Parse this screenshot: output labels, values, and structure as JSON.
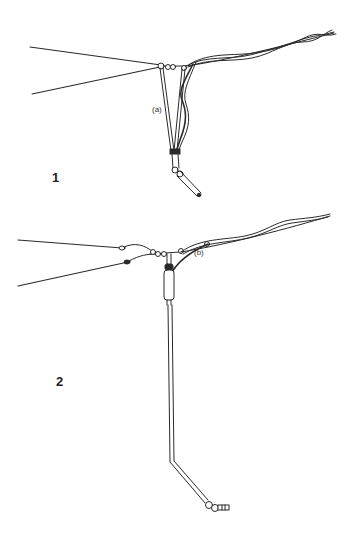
{
  "figures": [
    {
      "number": "1",
      "callout": "(a)",
      "description": "Wire antenna center junction with rigid support rod and twisted feeder, hinged end element"
    },
    {
      "number": "2",
      "callout": "(b)",
      "description": "Wire antenna center junction with tubular insulator and long bent support rod terminating in a connector"
    }
  ],
  "colors": {
    "line": "#2a2a2a",
    "background": "#ffffff"
  }
}
